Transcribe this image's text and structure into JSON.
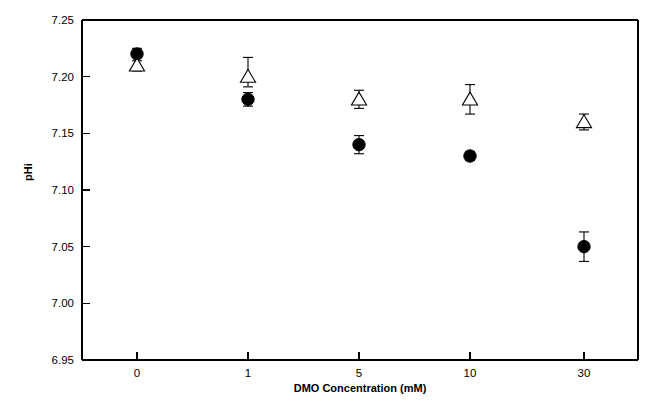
{
  "chart_data": {
    "type": "scatter",
    "title": "",
    "xlabel": "DMO Concentration (mM)",
    "ylabel": "pHi",
    "categories": [
      "0",
      "1",
      "5",
      "10",
      "30"
    ],
    "x_tick_labels": [
      "0",
      "1",
      "5",
      "10",
      "30"
    ],
    "y_tick_labels": [
      "7.25",
      "7.20",
      "7.15",
      "7.10",
      "7.05",
      "7.00",
      "6.95"
    ],
    "y_tick_values": [
      7.25,
      7.2,
      7.15,
      7.1,
      7.05,
      7.0,
      6.95
    ],
    "ylim": [
      6.95,
      7.25
    ],
    "grid": false,
    "legend": "none",
    "series": [
      {
        "name": "filled-circle",
        "marker": "filled-circle",
        "color": "#000000",
        "values": [
          7.22,
          7.18,
          7.14,
          7.13,
          7.05
        ],
        "err_upper": [
          0.005,
          0.006,
          0.008,
          0.004,
          0.013
        ],
        "err_lower": [
          0.0,
          0.006,
          0.008,
          0.004,
          0.013
        ]
      },
      {
        "name": "open-triangle",
        "marker": "open-triangle",
        "color": "#000000",
        "values": [
          7.21,
          7.2,
          7.18,
          7.18,
          7.16
        ],
        "err_upper": [
          0.004,
          0.017,
          0.008,
          0.013,
          0.007
        ],
        "err_lower": [
          0.005,
          0.009,
          0.008,
          0.013,
          0.007
        ]
      }
    ]
  },
  "axes": {
    "y_label_text": "pHi",
    "x_label_text": "DMO Concentration (mM)",
    "y_ticks": [
      {
        "label": "7.25"
      },
      {
        "label": "7.20"
      },
      {
        "label": "7.15"
      },
      {
        "label": "7.10"
      },
      {
        "label": "7.05"
      },
      {
        "label": "7.00"
      },
      {
        "label": "6.95"
      }
    ],
    "x_ticks": [
      {
        "label": "0"
      },
      {
        "label": "1"
      },
      {
        "label": "5"
      },
      {
        "label": "10"
      },
      {
        "label": "30"
      }
    ]
  },
  "style": {
    "axis_color": "#000000",
    "marker_fill": "#000000",
    "marker_open_fill": "#ffffff",
    "background": "#ffffff"
  }
}
